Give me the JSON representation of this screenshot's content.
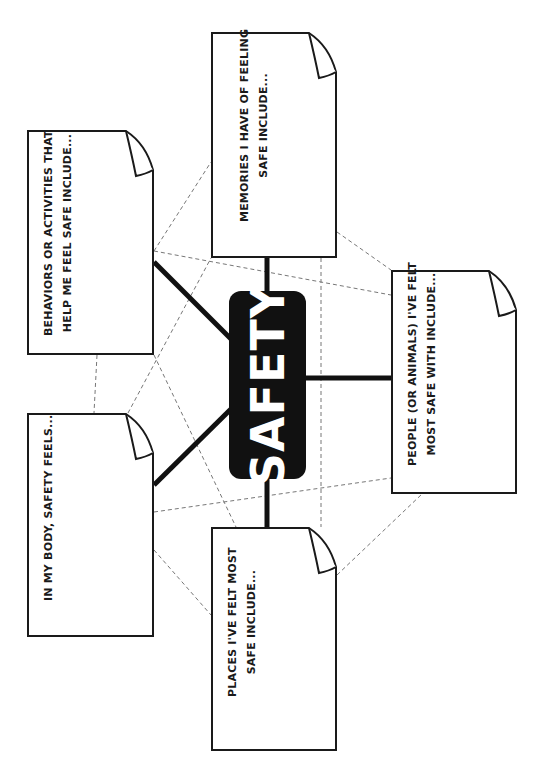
{
  "diagram": {
    "type": "mind-map worksheet",
    "orientation": "rotated 90deg counter-clockwise",
    "center": {
      "label": "SAFETY",
      "fill": "#111111",
      "text_color": "#ffffff"
    },
    "nodes": [
      {
        "id": "memories",
        "label": "MEMORIES I HAVE OF FEELING\nSAFE INCLUDE..."
      },
      {
        "id": "behaviors",
        "label": "BEHAVIORS OR ACTIVITIES THAT\nHELP ME FEEL SAFE INCLUDE..."
      },
      {
        "id": "body",
        "label": "IN MY BODY, SAFETY FEELS..."
      },
      {
        "id": "places",
        "label": "PLACES I'VE FELT MOST\nSAFE INCLUDE..."
      },
      {
        "id": "people",
        "label": "PEOPLE (OR ANIMALS) I'VE FELT\nMOST SAFE WITH INCLUDE..."
      }
    ],
    "connectors": {
      "solid": [
        "memories-center",
        "behaviors-center",
        "body-center",
        "places-center",
        "people-center"
      ],
      "style_solid": "thick black line",
      "style_dashed": "thin gray dashed lines linking cards"
    },
    "colors": {
      "stroke": "#1a1a1a",
      "dashed": "#777777",
      "background": "#ffffff"
    }
  }
}
